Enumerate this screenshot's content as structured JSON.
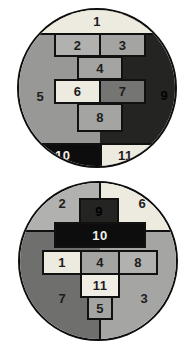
{
  "palette": {
    "background": "#ffffff",
    "outline": "#111111",
    "cream": "#edeadf",
    "light_gray": "#b1b1af",
    "mid_gray": "#a4a4a2",
    "gray": "#989896",
    "dark_gray": "#757573",
    "quadrant_dark_gray": "#6f6f6d",
    "near_black": "#242422",
    "black": "#0d0d0d",
    "number_dark": "#1d1d1d",
    "number_white": "#f2f1ec"
  },
  "top_circle": {
    "description": "circle divided into numbered regions and bricks",
    "pieces": {
      "1": "1",
      "2": "2",
      "3": "3",
      "4": "4",
      "5": "5",
      "6": "6",
      "7": "7",
      "8": "8",
      "9": "9",
      "10": "10",
      "11": "11"
    }
  },
  "bottom_circle": {
    "description": "circle divided into numbered quadrants and bricks",
    "pieces": {
      "1": "1",
      "2": "2",
      "3": "3",
      "4": "4",
      "5": "5",
      "6": "6",
      "7": "7",
      "8": "8",
      "9": "9",
      "10": "10",
      "11": "11"
    }
  }
}
